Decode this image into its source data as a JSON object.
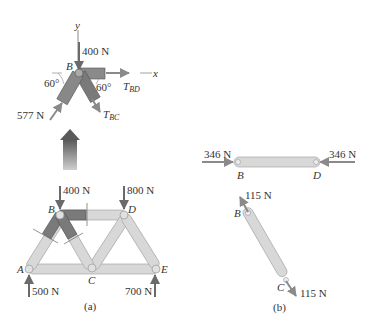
{
  "panel_a": {
    "caption": "(a)",
    "fbd_joint_b": {
      "axis_y": "y",
      "axis_x": "x",
      "joint_label": "B",
      "load_top": "400 N",
      "angle_left": "60°",
      "angle_right": "60°",
      "force_ab": "577 N",
      "tension_bd": "T",
      "tension_bd_sub": "BD",
      "tension_bc": "T",
      "tension_bc_sub": "BC"
    },
    "truss": {
      "joints": [
        "A",
        "B",
        "C",
        "D",
        "E"
      ],
      "load_b": "400 N",
      "load_d": "800 N",
      "reaction_a": "500 N",
      "reaction_e": "700 N"
    }
  },
  "panel_b": {
    "caption": "(b)",
    "member_bd": {
      "force_left": "346 N",
      "force_right": "346 N",
      "end_left": "B",
      "end_right": "D"
    },
    "member_bc": {
      "force_top": "115 N",
      "force_bottom": "115 N",
      "end_top": "B",
      "end_bottom": "C"
    }
  },
  "colors": {
    "member_light": "#d6d6d6",
    "member_dark": "#7a7a7a",
    "arrow": "#8a8a8a",
    "text": "#333333"
  }
}
